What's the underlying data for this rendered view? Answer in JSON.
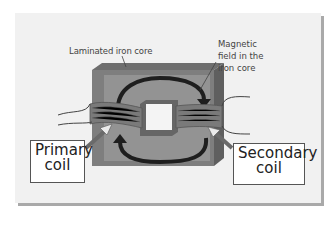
{
  "diagram": {
    "labels": {
      "core": "Laminated iron core",
      "field_line1": "Magnetic",
      "field_line2": "field in the",
      "field_line3": "iron core",
      "primary_line1": "Primary",
      "primary_line2": "coil",
      "secondary_line1": "Secondary",
      "secondary_line2": "coil"
    },
    "colors": {
      "background": "#f1f1f1",
      "shadow": "#a9a9a9",
      "core_front": "#8e8e8e",
      "core_top": "#6e6e6e",
      "core_side": "#5f5f5f",
      "window": "#f4f4f4",
      "coil": "#7a7a7a",
      "arrow": "#222222",
      "pointer": "#707070"
    }
  }
}
